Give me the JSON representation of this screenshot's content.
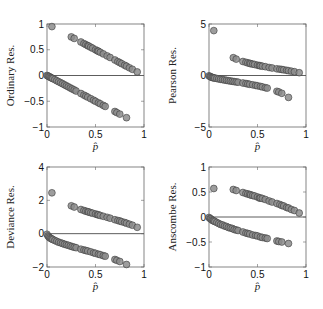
{
  "figure": {
    "background": "#ffffff",
    "marker_fill": "#8c8c8c",
    "marker_stroke": "#3a3a3a",
    "axis_color": "#666666",
    "zero_line_color": "#333333"
  },
  "chart_data": [
    {
      "type": "scatter",
      "title": "",
      "xlabel": "p̂",
      "ylabel": "Ordinary Res.",
      "xlim": [
        0,
        1
      ],
      "ylim": [
        -1,
        1
      ],
      "xticks": [
        "0",
        "0.5",
        "1"
      ],
      "yticks": [
        "-1",
        "-0.5",
        "0",
        "0.5",
        "1"
      ],
      "ytick_values": [
        -1,
        -0.5,
        0,
        0.5,
        1
      ],
      "zero_line": true,
      "grid": false,
      "series": [
        {
          "name": "y=1",
          "x": [
            0.05,
            0.25,
            0.28,
            0.35,
            0.38,
            0.4,
            0.42,
            0.43,
            0.45,
            0.47,
            0.5,
            0.52,
            0.53,
            0.55,
            0.58,
            0.62,
            0.65,
            0.7,
            0.73,
            0.75,
            0.77,
            0.8,
            0.82,
            0.85,
            0.88,
            0.93
          ],
          "y": [
            0.95,
            0.75,
            0.72,
            0.65,
            0.62,
            0.6,
            0.58,
            0.57,
            0.55,
            0.53,
            0.5,
            0.48,
            0.47,
            0.45,
            0.42,
            0.38,
            0.35,
            0.3,
            0.27,
            0.25,
            0.23,
            0.2,
            0.18,
            0.15,
            0.12,
            0.07
          ]
        },
        {
          "name": "y=0",
          "x": [
            0.0,
            0.01,
            0.02,
            0.03,
            0.04,
            0.05,
            0.06,
            0.08,
            0.1,
            0.12,
            0.14,
            0.16,
            0.18,
            0.2,
            0.22,
            0.24,
            0.26,
            0.28,
            0.3,
            0.35,
            0.38,
            0.4,
            0.42,
            0.45,
            0.48,
            0.5,
            0.53,
            0.55,
            0.58,
            0.6,
            0.7,
            0.72,
            0.75,
            0.82
          ],
          "y": [
            0.0,
            -0.01,
            -0.02,
            -0.03,
            -0.04,
            -0.05,
            -0.06,
            -0.08,
            -0.1,
            -0.12,
            -0.14,
            -0.16,
            -0.18,
            -0.2,
            -0.22,
            -0.24,
            -0.26,
            -0.28,
            -0.3,
            -0.35,
            -0.38,
            -0.4,
            -0.42,
            -0.45,
            -0.48,
            -0.5,
            -0.53,
            -0.55,
            -0.58,
            -0.6,
            -0.7,
            -0.72,
            -0.75,
            -0.82
          ]
        }
      ]
    },
    {
      "type": "scatter",
      "title": "",
      "xlabel": "p̂",
      "ylabel": "Pearson Res.",
      "xlim": [
        0,
        1
      ],
      "ylim": [
        -5,
        5
      ],
      "xticks": [
        "0",
        "0.5",
        "1"
      ],
      "yticks": [
        "-5",
        "0",
        "5"
      ],
      "ytick_values": [
        -5,
        0,
        5
      ],
      "zero_line": true,
      "grid": false,
      "series": [
        {
          "name": "y=1",
          "x": [
            0.05,
            0.25,
            0.28,
            0.35,
            0.38,
            0.4,
            0.42,
            0.43,
            0.45,
            0.47,
            0.5,
            0.52,
            0.53,
            0.55,
            0.58,
            0.62,
            0.65,
            0.7,
            0.73,
            0.75,
            0.77,
            0.8,
            0.82,
            0.85,
            0.88,
            0.93
          ],
          "y": [
            4.36,
            1.73,
            1.59,
            1.36,
            1.28,
            1.22,
            1.18,
            1.15,
            1.11,
            1.07,
            1.0,
            0.96,
            0.94,
            0.9,
            0.85,
            0.78,
            0.73,
            0.65,
            0.61,
            0.58,
            0.55,
            0.5,
            0.47,
            0.42,
            0.37,
            0.27
          ]
        },
        {
          "name": "y=0",
          "x": [
            0.0,
            0.01,
            0.02,
            0.03,
            0.04,
            0.05,
            0.06,
            0.08,
            0.1,
            0.12,
            0.14,
            0.16,
            0.18,
            0.2,
            0.22,
            0.24,
            0.26,
            0.28,
            0.3,
            0.35,
            0.38,
            0.4,
            0.42,
            0.45,
            0.48,
            0.5,
            0.53,
            0.55,
            0.58,
            0.6,
            0.7,
            0.72,
            0.75,
            0.82
          ],
          "y": [
            -0.03,
            -0.1,
            -0.14,
            -0.18,
            -0.2,
            -0.23,
            -0.25,
            -0.29,
            -0.33,
            -0.37,
            -0.4,
            -0.44,
            -0.47,
            -0.5,
            -0.53,
            -0.56,
            -0.59,
            -0.62,
            -0.65,
            -0.73,
            -0.78,
            -0.82,
            -0.85,
            -0.9,
            -0.96,
            -1.0,
            -1.06,
            -1.11,
            -1.18,
            -1.22,
            -1.53,
            -1.6,
            -1.73,
            -2.13
          ]
        }
      ]
    },
    {
      "type": "scatter",
      "title": "",
      "xlabel": "p̂",
      "ylabel": "Deviance Res.",
      "xlim": [
        0,
        1
      ],
      "ylim": [
        -2,
        4
      ],
      "xticks": [
        "0",
        "0.5",
        "1"
      ],
      "yticks": [
        "-2",
        "0",
        "2",
        "4"
      ],
      "ytick_values": [
        -2,
        0,
        2,
        4
      ],
      "zero_line": true,
      "grid": false,
      "series": [
        {
          "name": "y=1",
          "x": [
            0.05,
            0.25,
            0.28,
            0.35,
            0.38,
            0.4,
            0.42,
            0.43,
            0.45,
            0.47,
            0.5,
            0.52,
            0.53,
            0.55,
            0.58,
            0.62,
            0.65,
            0.7,
            0.73,
            0.75,
            0.77,
            0.8,
            0.82,
            0.85,
            0.88,
            0.93
          ],
          "y": [
            2.45,
            1.67,
            1.6,
            1.45,
            1.39,
            1.35,
            1.32,
            1.3,
            1.26,
            1.23,
            1.18,
            1.14,
            1.13,
            1.09,
            1.04,
            0.98,
            0.93,
            0.84,
            0.79,
            0.76,
            0.72,
            0.67,
            0.63,
            0.57,
            0.51,
            0.38
          ]
        },
        {
          "name": "y=0",
          "x": [
            0.0,
            0.01,
            0.02,
            0.03,
            0.04,
            0.05,
            0.06,
            0.08,
            0.1,
            0.12,
            0.14,
            0.16,
            0.18,
            0.2,
            0.22,
            0.24,
            0.26,
            0.28,
            0.3,
            0.35,
            0.38,
            0.4,
            0.42,
            0.45,
            0.48,
            0.5,
            0.53,
            0.55,
            0.58,
            0.6,
            0.7,
            0.72,
            0.75,
            0.82
          ],
          "y": [
            -0.04,
            -0.14,
            -0.2,
            -0.25,
            -0.29,
            -0.32,
            -0.35,
            -0.41,
            -0.46,
            -0.51,
            -0.55,
            -0.59,
            -0.63,
            -0.67,
            -0.7,
            -0.74,
            -0.78,
            -0.81,
            -0.84,
            -0.93,
            -0.98,
            -1.01,
            -1.04,
            -1.09,
            -1.15,
            -1.18,
            -1.23,
            -1.26,
            -1.32,
            -1.35,
            -1.55,
            -1.6,
            -1.67,
            -1.85
          ]
        }
      ]
    },
    {
      "type": "scatter",
      "title": "",
      "xlabel": "p̂",
      "ylabel": "Anscombe Res.",
      "xlim": [
        0,
        1
      ],
      "ylim": [
        -1,
        1
      ],
      "xticks": [
        "0",
        "0.5",
        "1"
      ],
      "yticks": [
        "-1",
        "-0.5",
        "0",
        "0.5",
        "1"
      ],
      "ytick_values": [
        -1,
        -0.5,
        0,
        0.5,
        1
      ],
      "zero_line": true,
      "grid": false,
      "series": [
        {
          "name": "y=1",
          "x": [
            0.05,
            0.25,
            0.28,
            0.35,
            0.38,
            0.4,
            0.42,
            0.43,
            0.45,
            0.47,
            0.5,
            0.52,
            0.53,
            0.55,
            0.58,
            0.62,
            0.65,
            0.7,
            0.73,
            0.75,
            0.77,
            0.8,
            0.82,
            0.85,
            0.88,
            0.93
          ],
          "y": [
            0.57,
            0.55,
            0.53,
            0.49,
            0.47,
            0.46,
            0.45,
            0.44,
            0.43,
            0.42,
            0.4,
            0.38,
            0.38,
            0.37,
            0.35,
            0.32,
            0.3,
            0.27,
            0.25,
            0.23,
            0.22,
            0.19,
            0.18,
            0.15,
            0.13,
            0.08
          ]
        },
        {
          "name": "y=0",
          "x": [
            0.0,
            0.01,
            0.02,
            0.03,
            0.04,
            0.05,
            0.06,
            0.08,
            0.1,
            0.12,
            0.14,
            0.16,
            0.18,
            0.2,
            0.22,
            0.24,
            0.26,
            0.28,
            0.3,
            0.35,
            0.38,
            0.4,
            0.42,
            0.45,
            0.48,
            0.5,
            0.53,
            0.55,
            0.58,
            0.6,
            0.7,
            0.72,
            0.75,
            0.82
          ],
          "y": [
            -0.01,
            -0.03,
            -0.04,
            -0.06,
            -0.07,
            -0.08,
            -0.09,
            -0.11,
            -0.13,
            -0.15,
            -0.16,
            -0.18,
            -0.19,
            -0.21,
            -0.22,
            -0.23,
            -0.25,
            -0.26,
            -0.27,
            -0.3,
            -0.32,
            -0.33,
            -0.34,
            -0.36,
            -0.37,
            -0.38,
            -0.4,
            -0.41,
            -0.42,
            -0.43,
            -0.48,
            -0.49,
            -0.5,
            -0.53
          ]
        }
      ]
    }
  ],
  "layout": {
    "panels": [
      {
        "left": 47,
        "top": 24,
        "right": 144,
        "bottom": 127,
        "ylabel_x": 14
      },
      {
        "left": 209,
        "top": 24,
        "right": 306,
        "bottom": 127,
        "ylabel_x": 176
      },
      {
        "left": 47,
        "top": 167,
        "right": 144,
        "bottom": 267,
        "ylabel_x": 14
      },
      {
        "left": 209,
        "top": 167,
        "right": 306,
        "bottom": 267,
        "ylabel_x": 176
      }
    ],
    "marker_radius": 3.4
  }
}
